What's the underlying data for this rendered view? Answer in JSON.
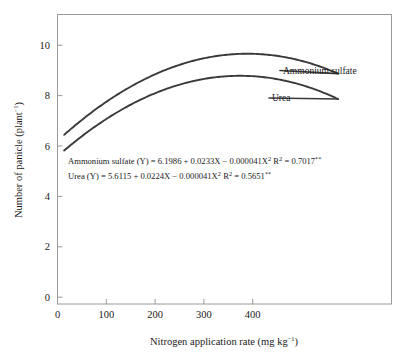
{
  "chart_data": {
    "type": "line",
    "title": "",
    "xlabel": "Nitrogen application rate (mg kg",
    "xlabel_sup": "−1",
    "xlabel_tail": ")",
    "ylabel": "Number of panicle (plant",
    "ylabel_sup": "−1",
    "ylabel_tail": ")",
    "xlim": [
      0,
      500
    ],
    "ylim": [
      0,
      11
    ],
    "xticks": [
      0,
      100,
      200,
      300,
      400
    ],
    "yticks": [
      0,
      2,
      4,
      6,
      8,
      10
    ],
    "grid": false,
    "legend_position": "inline-right-of-curves",
    "x_domain_plotted": [
      10,
      420
    ],
    "series": [
      {
        "name": "Ammonium sulfate",
        "model": "quadratic",
        "intercept": 6.1986,
        "linear_coef": 0.0233,
        "quadratic_coef": -4.1e-05,
        "r_squared": 0.7017,
        "significance": "**",
        "color": "#3a3a3a",
        "x": [
          10,
          50,
          100,
          150,
          200,
          250,
          284,
          300,
          350,
          400,
          420
        ],
        "values": [
          6.43,
          7.26,
          8.12,
          8.77,
          9.22,
          9.46,
          9.51,
          9.5,
          9.33,
          8.96,
          8.77
        ]
      },
      {
        "name": "Urea",
        "model": "quadratic",
        "intercept": 5.6115,
        "linear_coef": 0.0224,
        "quadratic_coef": -4.1e-05,
        "r_squared": 0.5651,
        "significance": "**",
        "color": "#3a3a3a",
        "x": [
          10,
          50,
          100,
          150,
          200,
          250,
          273,
          300,
          350,
          400,
          420
        ],
        "values": [
          5.83,
          6.63,
          7.44,
          8.05,
          8.45,
          8.65,
          8.67,
          8.64,
          8.41,
          7.97,
          7.74
        ]
      }
    ],
    "annotations": [
      {
        "id": "equation-ammonium-sulfate",
        "text": "Ammonium sulfate (Y) = 6.1986 + 0.0233X − 0.000041X²  R² = 0.7017**"
      },
      {
        "id": "equation-urea",
        "text": "Urea (Y) = 5.6115 + 0.0224X − 0.000041X²     R² = 0.5651**"
      }
    ]
  },
  "equations": {
    "ammonium_sulfate": {
      "prefix": "Ammonium sulfate (Y) = 6.1986 + 0.0233X − 0.000041X",
      "exp1": "2",
      "mid": "  R",
      "exp2": "2",
      "suffix": " = 0.7017",
      "stars": "**"
    },
    "urea": {
      "prefix": "Urea (Y) = 5.6115 + 0.0224X − 0.000041X",
      "exp1": "2",
      "mid": "     R",
      "exp2": "2",
      "suffix": " = 0.5651",
      "stars": "**"
    }
  },
  "labels": {
    "series_ammonium_sulfate": "Ammonium sulfate",
    "series_urea": "Urea",
    "y_axis_main": "Number of panicle (plant",
    "y_axis_sup": "−1",
    "y_axis_tail": ")",
    "x_axis_main": "Nitrogen application rate (mg kg",
    "x_axis_sup": "−1",
    "x_axis_tail": ")"
  },
  "ticks": {
    "x": [
      "0",
      "100",
      "200",
      "300",
      "400"
    ],
    "y": [
      "0",
      "2",
      "4",
      "6",
      "8",
      "10"
    ]
  },
  "colors": {
    "curve": "#3a3a3a",
    "frame": "#9a9a9a",
    "text": "#1a1a1a",
    "background": "#ffffff"
  }
}
